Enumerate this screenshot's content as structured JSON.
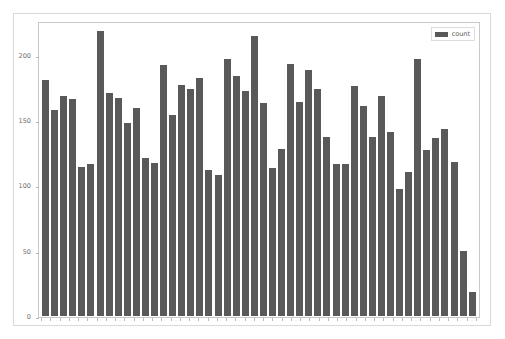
{
  "chart_data": {
    "type": "bar",
    "title": "",
    "xlabel": "",
    "ylabel": "",
    "ylim": [
      0,
      225
    ],
    "yticks": [
      0,
      50,
      100,
      150,
      200
    ],
    "ytick_labels": [
      "0",
      "50",
      "100",
      "150",
      "200"
    ],
    "grid": false,
    "legend": {
      "position": "upper-right",
      "entries": [
        {
          "label": "count",
          "color": "#595959"
        }
      ]
    },
    "series": [
      {
        "name": "count",
        "color": "#595959",
        "values": [
          181,
          158,
          168,
          166,
          114,
          116,
          218,
          171,
          167,
          148,
          159,
          121,
          117,
          192,
          154,
          177,
          174,
          182,
          112,
          108,
          197,
          184,
          172,
          214,
          163,
          113,
          128,
          193,
          164,
          188,
          174,
          137,
          116,
          116,
          176,
          161,
          137,
          168,
          141,
          97,
          110,
          197,
          127,
          136,
          143,
          118,
          50,
          18
        ]
      }
    ],
    "categories": [
      "1",
      "2",
      "3",
      "4",
      "5",
      "6",
      "7",
      "8",
      "9",
      "10",
      "11",
      "12",
      "13",
      "14",
      "15",
      "16",
      "17",
      "18",
      "19",
      "20",
      "21",
      "22",
      "23",
      "24",
      "25",
      "26",
      "27",
      "28",
      "29",
      "30",
      "31",
      "32",
      "33",
      "34",
      "35",
      "36",
      "37",
      "38",
      "39",
      "40",
      "41",
      "42",
      "43",
      "44",
      "45",
      "46",
      "47",
      "48"
    ],
    "bar_color": "#595959",
    "background_color": "#ffffff",
    "axes_frame_color": "#c9c9c9",
    "tick_label_color": "#6e6e6e"
  }
}
